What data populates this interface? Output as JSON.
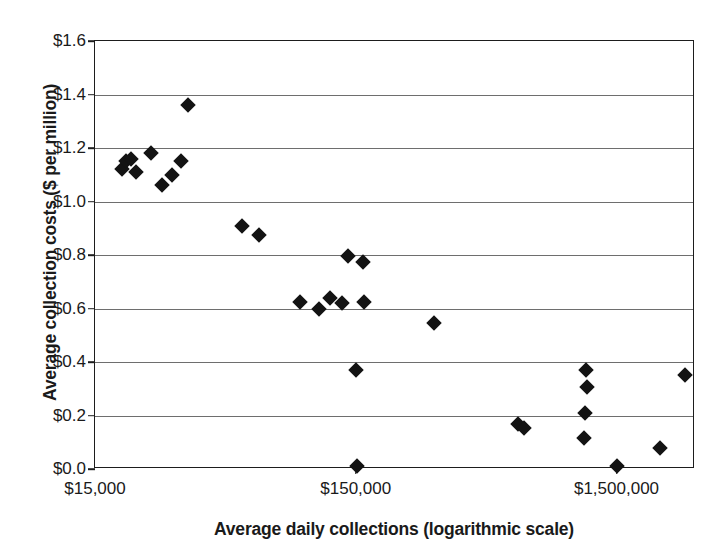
{
  "chart_data": {
    "type": "scatter",
    "title": "",
    "xlabel": "Average daily collections (logarithmic scale)",
    "ylabel": "Average collection costs ($ per million)",
    "x_scale": "log",
    "xlim": [
      15000,
      3000000
    ],
    "ylim": [
      0.0,
      1.6
    ],
    "grid": true,
    "legend": null,
    "x_ticks": [
      {
        "value": 15000,
        "label": "$15,000"
      },
      {
        "value": 150000,
        "label": "$150,000"
      },
      {
        "value": 1500000,
        "label": "$1,500,000"
      }
    ],
    "y_ticks": [
      {
        "value": 0.0,
        "label": "$0.0"
      },
      {
        "value": 0.2,
        "label": "$0.2"
      },
      {
        "value": 0.4,
        "label": "$0.4"
      },
      {
        "value": 0.6,
        "label": "$0.6"
      },
      {
        "value": 0.8,
        "label": "$0.8"
      },
      {
        "value": 1.0,
        "label": "$1.0"
      },
      {
        "value": 1.2,
        "label": "$1.2"
      },
      {
        "value": 1.4,
        "label": "$1.4"
      },
      {
        "value": 1.6,
        "label": "$1.6"
      }
    ],
    "points": [
      {
        "x": 19000,
        "y": 1.12
      },
      {
        "x": 19800,
        "y": 1.15
      },
      {
        "x": 20600,
        "y": 1.16
      },
      {
        "x": 21500,
        "y": 1.11
      },
      {
        "x": 24500,
        "y": 1.18
      },
      {
        "x": 27000,
        "y": 1.06
      },
      {
        "x": 29500,
        "y": 1.1
      },
      {
        "x": 32000,
        "y": 1.15
      },
      {
        "x": 34000,
        "y": 1.36
      },
      {
        "x": 55000,
        "y": 0.91
      },
      {
        "x": 64000,
        "y": 0.875
      },
      {
        "x": 92000,
        "y": 0.625
      },
      {
        "x": 108000,
        "y": 0.6
      },
      {
        "x": 119000,
        "y": 0.64
      },
      {
        "x": 133000,
        "y": 0.62
      },
      {
        "x": 140000,
        "y": 0.795
      },
      {
        "x": 160000,
        "y": 0.775
      },
      {
        "x": 162000,
        "y": 0.625
      },
      {
        "x": 150000,
        "y": 0.37
      },
      {
        "x": 152000,
        "y": 0.01
      },
      {
        "x": 300000,
        "y": 0.545
      },
      {
        "x": 630000,
        "y": 0.17
      },
      {
        "x": 660000,
        "y": 0.155
      },
      {
        "x": 1150000,
        "y": 0.37
      },
      {
        "x": 1160000,
        "y": 0.305
      },
      {
        "x": 1140000,
        "y": 0.21
      },
      {
        "x": 1130000,
        "y": 0.115
      },
      {
        "x": 1500000,
        "y": 0.01
      },
      {
        "x": 2200000,
        "y": 0.08
      },
      {
        "x": 2750000,
        "y": 0.35
      }
    ]
  },
  "axes": {
    "x_title": "Average daily collections (logarithmic scale)",
    "y_title": "Average collection costs ($ per million)"
  }
}
